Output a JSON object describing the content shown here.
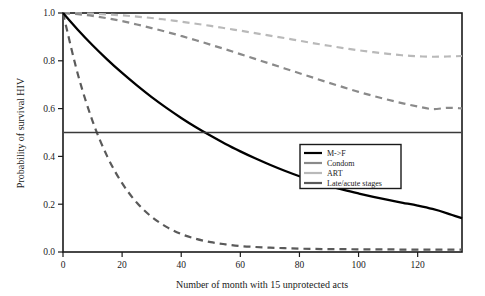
{
  "chart_data": {
    "type": "line",
    "title": "",
    "xlabel": "Number of month with 15 unprotected acts",
    "ylabel": "Probability of survival HIV",
    "xlim": [
      0,
      135
    ],
    "ylim": [
      0.0,
      1.0
    ],
    "xticks": [
      0,
      20,
      40,
      60,
      80,
      100,
      120
    ],
    "xticklabels": [
      "0",
      "20",
      "40",
      "60",
      "80",
      "100",
      "120"
    ],
    "yticks": [
      0.0,
      0.2,
      0.4,
      0.6,
      0.8,
      1.0
    ],
    "yticklabels": [
      "0.0",
      "0.2",
      "0.4",
      "0.6",
      "0.8",
      "1.0"
    ],
    "grid": false,
    "legend_position": "center-right",
    "annotations": [
      {
        "name": "median-survival-line",
        "type": "hline",
        "y": 0.5,
        "label": ""
      }
    ],
    "x": [
      0,
      5,
      10,
      15,
      20,
      25,
      30,
      35,
      40,
      45,
      50,
      55,
      60,
      65,
      70,
      75,
      80,
      85,
      90,
      95,
      100,
      105,
      110,
      115,
      120,
      125,
      130,
      135
    ],
    "series": [
      {
        "name": "M->F",
        "color": "#000000",
        "style": "solid",
        "values": [
          1.0,
          0.93,
          0.865,
          0.805,
          0.749,
          0.697,
          0.648,
          0.603,
          0.561,
          0.522,
          0.486,
          0.452,
          0.421,
          0.392,
          0.365,
          0.34,
          0.317,
          0.296,
          0.277,
          0.26,
          0.245,
          0.231,
          0.218,
          0.206,
          0.194,
          0.18,
          0.162,
          0.141
        ]
      },
      {
        "name": "Condom",
        "color": "#8a8a8a",
        "style": "dashed",
        "values": [
          1.0,
          0.995,
          0.988,
          0.978,
          0.966,
          0.952,
          0.937,
          0.921,
          0.904,
          0.886,
          0.867,
          0.848,
          0.828,
          0.808,
          0.788,
          0.768,
          0.748,
          0.728,
          0.708,
          0.689,
          0.67,
          0.653,
          0.637,
          0.622,
          0.609,
          0.598,
          0.603,
          0.601
        ]
      },
      {
        "name": "ART",
        "color": "#b9b9b9",
        "style": "dashed",
        "values": [
          1.0,
          0.999,
          0.997,
          0.994,
          0.99,
          0.985,
          0.979,
          0.972,
          0.964,
          0.955,
          0.946,
          0.936,
          0.926,
          0.916,
          0.905,
          0.895,
          0.884,
          0.873,
          0.863,
          0.853,
          0.844,
          0.836,
          0.829,
          0.823,
          0.819,
          0.817,
          0.818,
          0.82
        ]
      },
      {
        "name": "Late/acute stages",
        "color": "#5a5a5a",
        "style": "dashed",
        "values": [
          1.0,
          0.745,
          0.548,
          0.399,
          0.288,
          0.206,
          0.147,
          0.105,
          0.075,
          0.055,
          0.041,
          0.032,
          0.025,
          0.021,
          0.018,
          0.016,
          0.014,
          0.013,
          0.012,
          0.012,
          0.011,
          0.011,
          0.011,
          0.01,
          0.01,
          0.01,
          0.01,
          0.01
        ]
      }
    ]
  },
  "legend": {
    "items": [
      {
        "label": "M->F",
        "color": "#000000"
      },
      {
        "label": "Condom",
        "color": "#8a8a8a"
      },
      {
        "label": "ART",
        "color": "#b9b9b9"
      },
      {
        "label": "Late/acute stages",
        "color": "#5a5a5a"
      }
    ]
  }
}
